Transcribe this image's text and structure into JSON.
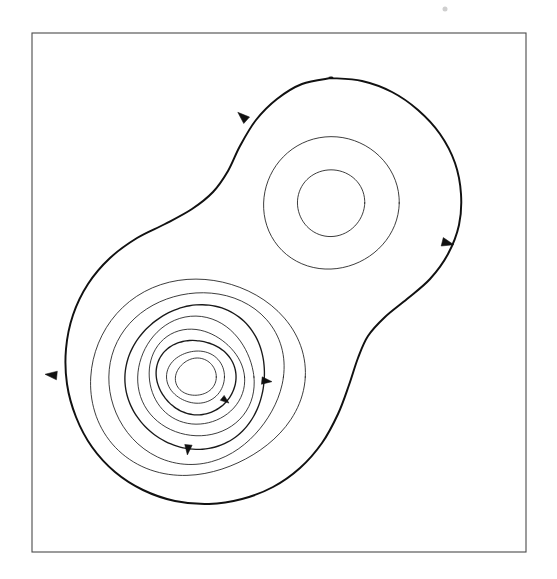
{
  "figure": {
    "title": "",
    "caption": "",
    "background_color": "#ffffff",
    "frame": {
      "name": "plot-border",
      "x": 32,
      "y": 33,
      "width": 494,
      "height": 519,
      "stroke_color": "#4a4a4a",
      "stroke_width": 1.1
    }
  },
  "chart_data": {
    "type": "line",
    "title": "",
    "subtitle": "",
    "xlabel": "",
    "ylabel": "",
    "grid": false,
    "legend": "none",
    "xlim": [
      32,
      526
    ],
    "ylim": [
      33,
      552
    ],
    "fixed_points": [
      {
        "name": "center-lower-left",
        "type": "center",
        "x": 196,
        "y": 377,
        "orbit_count": 8
      },
      {
        "name": "center-upper-right",
        "type": "center",
        "x": 331,
        "y": 203,
        "orbit_count": 2
      }
    ],
    "series": [
      {
        "name": "separatrix",
        "style": "bold",
        "closed": true,
        "stroke_width": 1.95,
        "points": [
          [
            331,
            78
          ],
          [
            362,
            81
          ],
          [
            392,
            92
          ],
          [
            418,
            110
          ],
          [
            440,
            134
          ],
          [
            455,
            163
          ],
          [
            461,
            194
          ],
          [
            459,
            225
          ],
          [
            448,
            254
          ],
          [
            430,
            279
          ],
          [
            407,
            299
          ],
          [
            385,
            317
          ],
          [
            368,
            336
          ],
          [
            358,
            358
          ],
          [
            349,
            385
          ],
          [
            338,
            414
          ],
          [
            322,
            443
          ],
          [
            300,
            468
          ],
          [
            273,
            487
          ],
          [
            242,
            499
          ],
          [
            209,
            504
          ],
          [
            175,
            501
          ],
          [
            143,
            490
          ],
          [
            115,
            472
          ],
          [
            92,
            447
          ],
          [
            76,
            417
          ],
          [
            67,
            384
          ],
          [
            66,
            349
          ],
          [
            73,
            315
          ],
          [
            88,
            284
          ],
          [
            110,
            258
          ],
          [
            137,
            238
          ],
          [
            165,
            224
          ],
          [
            192,
            209
          ],
          [
            213,
            192
          ],
          [
            228,
            171
          ],
          [
            240,
            146
          ],
          [
            256,
            120
          ],
          [
            277,
            99
          ],
          [
            302,
            84
          ],
          [
            331,
            78
          ]
        ]
      },
      {
        "name": "lower-left-orbit-1",
        "style": "thin",
        "closed": true,
        "stroke_width": 0.85,
        "center": [
          196,
          377
        ],
        "rx": 105,
        "ry": 100
      },
      {
        "name": "lower-left-orbit-2",
        "style": "thin",
        "closed": true,
        "stroke_width": 0.85,
        "center": [
          196,
          377
        ],
        "rx": 88,
        "ry": 85
      },
      {
        "name": "lower-left-orbit-3",
        "style": "medium",
        "closed": true,
        "stroke_width": 1.35,
        "center": [
          196,
          377
        ],
        "rx": 72,
        "ry": 70
      },
      {
        "name": "lower-left-orbit-4",
        "style": "thin",
        "closed": true,
        "stroke_width": 0.85,
        "center": [
          196,
          377
        ],
        "rx": 60,
        "ry": 58
      },
      {
        "name": "lower-left-orbit-5",
        "style": "thin",
        "closed": true,
        "stroke_width": 0.85,
        "center": [
          196,
          377
        ],
        "rx": 48,
        "ry": 47
      },
      {
        "name": "lower-left-orbit-6",
        "style": "medium",
        "closed": true,
        "stroke_width": 1.35,
        "center": [
          196,
          377
        ],
        "rx": 39,
        "ry": 38
      },
      {
        "name": "lower-left-orbit-7",
        "style": "thin",
        "closed": true,
        "stroke_width": 0.85,
        "center": [
          196,
          377
        ],
        "rx": 28,
        "ry": 27
      },
      {
        "name": "lower-left-orbit-8",
        "style": "thin",
        "closed": true,
        "stroke_width": 0.85,
        "center": [
          196,
          377
        ],
        "rx": 20,
        "ry": 19
      },
      {
        "name": "upper-right-orbit-1",
        "style": "thin",
        "closed": true,
        "stroke_width": 0.85,
        "center": [
          331,
          203
        ],
        "rx": 68,
        "ry": 66
      },
      {
        "name": "upper-right-orbit-2",
        "style": "thin",
        "closed": true,
        "stroke_width": 0.85,
        "center": [
          331,
          203
        ],
        "rx": 34,
        "ry": 33
      }
    ],
    "arrows": [
      {
        "name": "arrow-separatrix-top-left",
        "x": 243,
        "y": 117,
        "angle": -48,
        "size": 7
      },
      {
        "name": "arrow-separatrix-right",
        "x": 447,
        "y": 243,
        "angle": 104,
        "size": 7
      },
      {
        "name": "arrow-separatrix-left",
        "x": 52,
        "y": 375,
        "angle": -84,
        "size": 7
      },
      {
        "name": "arrow-orbit-3-right",
        "x": 266,
        "y": 381,
        "angle": 96,
        "size": 6
      },
      {
        "name": "arrow-orbit-3-bottom",
        "x": 188,
        "y": 449,
        "angle": 186,
        "size": 6
      },
      {
        "name": "arrow-orbit-6-bottom-right",
        "x": 225,
        "y": 400,
        "angle": 128,
        "size": 5
      }
    ],
    "artifacts": [
      {
        "name": "dust-speck",
        "x": 445,
        "y": 9,
        "r": 2.5,
        "color": "#cfcfcf"
      }
    ]
  }
}
